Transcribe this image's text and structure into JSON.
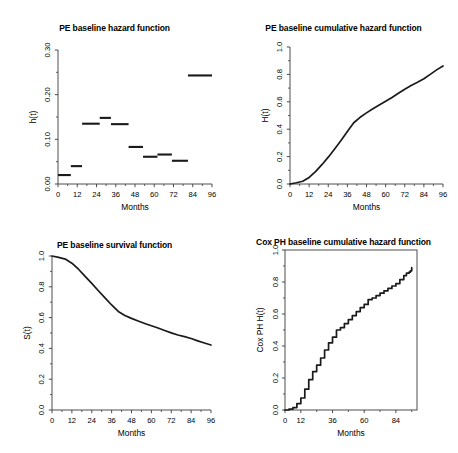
{
  "figure": {
    "background": "#ffffff",
    "line_color": "#1a1a1a",
    "axis_color": "#3a3a3a",
    "panel_count": 4
  },
  "panels": [
    {
      "id": "pe-baseline-hazard",
      "title": "PE baseline hazard function",
      "xlabel": "Months",
      "ylabel": "h(t)",
      "box": false
    },
    {
      "id": "pe-baseline-cumulative-hazard",
      "title": "PE baseline cumulative hazard function",
      "xlabel": "Months",
      "ylabel": "H(t)",
      "box": false
    },
    {
      "id": "pe-baseline-survival",
      "title": "PE baseline survival function",
      "xlabel": "Months",
      "ylabel": "S(t)",
      "box": false
    },
    {
      "id": "cox-ph-baseline-cumulative-hazard",
      "title": "Cox PH baseline cumulative hazard function",
      "xlabel": "Months",
      "ylabel": "Cox PH H(t)",
      "box": true
    }
  ],
  "chart_data": [
    {
      "type": "bar",
      "id": "pe-baseline-hazard",
      "title": "PE baseline hazard function",
      "xlabel": "Months",
      "ylabel": "h(t)",
      "xlim": [
        0,
        96
      ],
      "ylim": [
        0,
        0.3
      ],
      "xticks": [
        0,
        12,
        24,
        36,
        48,
        60,
        72,
        84,
        96
      ],
      "xtick_labels": [
        "0",
        "12",
        "24",
        "36",
        "48",
        "60",
        "72",
        "84",
        "96"
      ],
      "xminorticks": [
        6,
        18,
        30,
        42,
        54,
        66,
        78,
        90
      ],
      "yticks": [
        0.0,
        0.1,
        0.2,
        0.3
      ],
      "ytick_labels": [
        "0.00",
        "0.10",
        "0.20",
        "0.30"
      ],
      "yminorticks": [
        0.05,
        0.15,
        0.25
      ],
      "grid": false,
      "legend": null,
      "note": "piecewise-constant hazard drawn as horizontal segments",
      "segments": [
        {
          "x0": 0,
          "x1": 8,
          "value": 0.02
        },
        {
          "x0": 8,
          "x1": 15,
          "value": 0.04
        },
        {
          "x0": 15,
          "x1": 26,
          "value": 0.135
        },
        {
          "x0": 26,
          "x1": 33,
          "value": 0.148
        },
        {
          "x0": 33,
          "x1": 44,
          "value": 0.134
        },
        {
          "x0": 44,
          "x1": 53,
          "value": 0.083
        },
        {
          "x0": 53,
          "x1": 62,
          "value": 0.061
        },
        {
          "x0": 62,
          "x1": 71,
          "value": 0.066
        },
        {
          "x0": 71,
          "x1": 81,
          "value": 0.052
        },
        {
          "x0": 81,
          "x1": 96,
          "value": 0.243
        }
      ]
    },
    {
      "type": "line",
      "id": "pe-baseline-cumulative-hazard",
      "title": "PE baseline cumulative hazard function",
      "xlabel": "Months",
      "ylabel": "H(t)",
      "xlim": [
        0,
        96
      ],
      "ylim": [
        0,
        1.0
      ],
      "xticks": [
        0,
        12,
        24,
        36,
        48,
        60,
        72,
        84,
        96
      ],
      "xtick_labels": [
        "0",
        "12",
        "24",
        "36",
        "48",
        "60",
        "72",
        "84",
        "96"
      ],
      "xminorticks": [
        6,
        18,
        30,
        42,
        54,
        66,
        78,
        90
      ],
      "yticks": [
        0.0,
        0.2,
        0.4,
        0.6,
        0.8,
        1.0
      ],
      "ytick_labels": [
        "0.0",
        "0.2",
        "0.4",
        "0.6",
        "0.8",
        "1.0"
      ],
      "yminorticks": [
        0.1,
        0.3,
        0.5,
        0.7,
        0.9
      ],
      "grid": false,
      "legend": null,
      "x": [
        0,
        4,
        8,
        12,
        16,
        20,
        24,
        28,
        32,
        36,
        40,
        44,
        48,
        52,
        56,
        60,
        64,
        68,
        72,
        76,
        80,
        84,
        88,
        92,
        96
      ],
      "y": [
        0.0,
        0.009,
        0.02,
        0.048,
        0.09,
        0.141,
        0.196,
        0.256,
        0.318,
        0.383,
        0.447,
        0.487,
        0.519,
        0.549,
        0.576,
        0.604,
        0.632,
        0.662,
        0.692,
        0.719,
        0.742,
        0.768,
        0.8,
        0.833,
        0.862
      ]
    },
    {
      "type": "line",
      "id": "pe-baseline-survival",
      "title": "PE baseline survival function",
      "xlabel": "Months",
      "ylabel": "S(t)",
      "xlim": [
        0,
        96
      ],
      "ylim": [
        0,
        1.0
      ],
      "xticks": [
        0,
        12,
        24,
        36,
        48,
        60,
        72,
        84,
        96
      ],
      "xtick_labels": [
        "0",
        "12",
        "24",
        "36",
        "48",
        "60",
        "72",
        "84",
        "96"
      ],
      "xminorticks": [
        6,
        18,
        30,
        42,
        54,
        66,
        78,
        90
      ],
      "yticks": [
        0.0,
        0.2,
        0.4,
        0.6,
        0.8,
        1.0
      ],
      "ytick_labels": [
        "0.0",
        "0.2",
        "0.4",
        "0.6",
        "0.8",
        "1.0"
      ],
      "yminorticks": [
        0.1,
        0.3,
        0.5,
        0.7,
        0.9
      ],
      "grid": false,
      "legend": null,
      "x": [
        0,
        4,
        8,
        12,
        16,
        20,
        24,
        28,
        32,
        36,
        40,
        44,
        48,
        52,
        56,
        60,
        64,
        68,
        72,
        76,
        80,
        84,
        88,
        92,
        96
      ],
      "y": [
        1.0,
        0.991,
        0.98,
        0.953,
        0.914,
        0.868,
        0.822,
        0.774,
        0.728,
        0.682,
        0.64,
        0.614,
        0.595,
        0.578,
        0.562,
        0.547,
        0.532,
        0.516,
        0.501,
        0.487,
        0.476,
        0.464,
        0.449,
        0.435,
        0.422
      ]
    },
    {
      "type": "line",
      "id": "cox-ph-baseline-cumulative-hazard",
      "title": "Cox PH baseline cumulative hazard function",
      "xlabel": "Months",
      "ylabel": "Cox PH H(t)",
      "xlim": [
        0,
        100
      ],
      "ylim": [
        0,
        1.0
      ],
      "xticks": [
        0,
        12,
        36,
        60,
        84
      ],
      "xtick_labels": [
        "0",
        "12",
        "36",
        "60",
        "84"
      ],
      "xminorticks": [
        24,
        48,
        72,
        96
      ],
      "yticks": [
        0.0,
        0.2,
        0.4,
        0.6,
        0.8,
        1.0
      ],
      "ytick_labels": [
        "0.0",
        "0.2",
        "0.4",
        "0.6",
        "0.8",
        "1.0"
      ],
      "yminorticks": [
        0.1,
        0.3,
        0.5,
        0.7,
        0.9
      ],
      "grid": false,
      "legend": null,
      "note": "Nelson-Aalen style step function, box frame around plot region",
      "x": [
        0,
        3,
        6,
        9,
        12,
        15,
        18,
        21,
        24,
        27,
        30,
        33,
        36,
        39,
        42,
        45,
        48,
        51,
        54,
        57,
        60,
        63,
        66,
        69,
        72,
        75,
        78,
        81,
        84,
        87,
        90,
        92,
        94,
        95,
        96
      ],
      "y": [
        0.0,
        0.005,
        0.015,
        0.04,
        0.075,
        0.13,
        0.19,
        0.24,
        0.28,
        0.325,
        0.375,
        0.42,
        0.455,
        0.5,
        0.515,
        0.54,
        0.565,
        0.59,
        0.615,
        0.64,
        0.66,
        0.69,
        0.7,
        0.715,
        0.73,
        0.745,
        0.76,
        0.775,
        0.79,
        0.815,
        0.84,
        0.855,
        0.862,
        0.87,
        0.89
      ]
    }
  ]
}
